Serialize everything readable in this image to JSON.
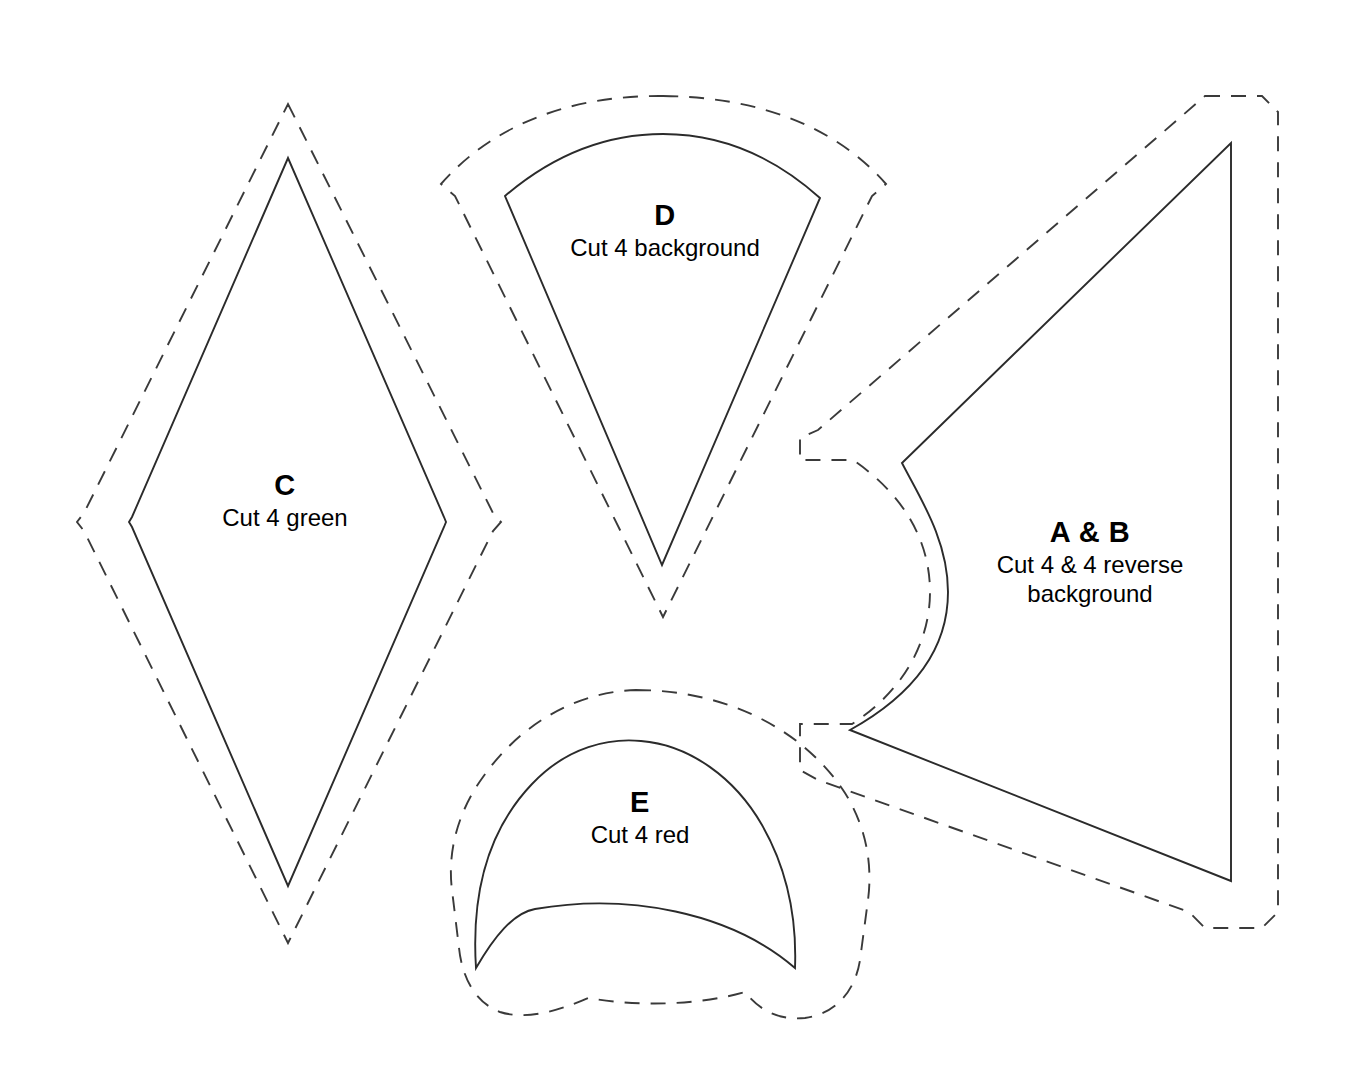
{
  "document": {
    "type": "quilt-pattern-template-sheet",
    "background_color": "#ffffff",
    "line_color": "#2b2b2b"
  },
  "pieces": [
    {
      "id": "c",
      "letter": "C",
      "cut_instruction": "Cut 4 green",
      "shape": "diamond",
      "has_seam_allowance": true
    },
    {
      "id": "d",
      "letter": "D",
      "cut_instruction": "Cut 4 background",
      "shape": "wedge",
      "has_seam_allowance": true
    },
    {
      "id": "ab",
      "letter": "A & B",
      "cut_instruction_line1": "Cut 4 & 4 reverse",
      "cut_instruction_line2": "background",
      "shape": "arrow-with-concave-notch",
      "has_seam_allowance": true
    },
    {
      "id": "e",
      "letter": "E",
      "cut_instruction": "Cut 4 red",
      "shape": "crescent",
      "has_seam_allowance": true
    }
  ]
}
